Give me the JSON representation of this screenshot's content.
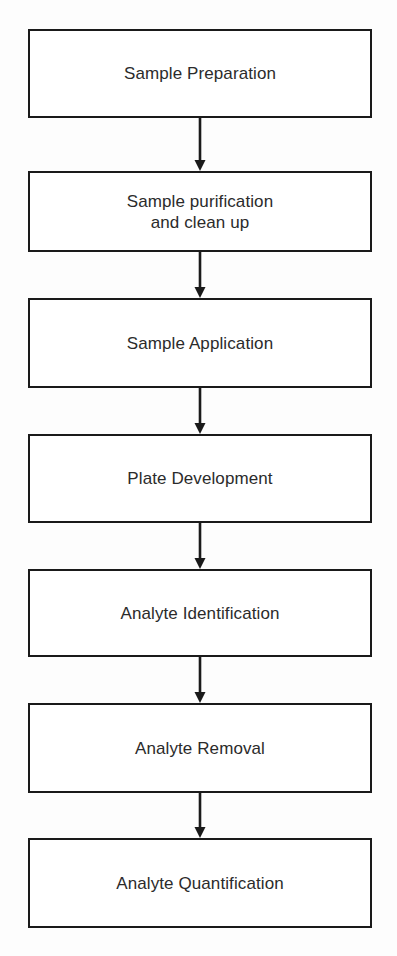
{
  "diagram": {
    "orientation": "vertical",
    "background_color": "#fdfdfd",
    "box_fill_color": "#ffffff",
    "line_color": "#1a1a1a",
    "text_color": "#2b2b2b",
    "nodes": [
      {
        "id": "sample-preparation",
        "label": "Sample Preparation",
        "top": 29,
        "height": 89
      },
      {
        "id": "sample-purification",
        "label": "Sample purification\nand clean up",
        "top": 171,
        "height": 81
      },
      {
        "id": "sample-application",
        "label": "Sample Application",
        "top": 298,
        "height": 90
      },
      {
        "id": "plate-development",
        "label": "Plate Development",
        "top": 434,
        "height": 89
      },
      {
        "id": "analyte-identification",
        "label": "Analyte Identification",
        "top": 569,
        "height": 88
      },
      {
        "id": "analyte-removal",
        "label": "Analyte Removal",
        "top": 703,
        "height": 90
      },
      {
        "id": "analyte-quantification",
        "label": "Analyte Quantification",
        "top": 838,
        "height": 90
      }
    ],
    "connectors": [
      {
        "id": "arrow-1",
        "from": "sample-preparation",
        "to": "sample-purification",
        "top": 118,
        "length": 53
      },
      {
        "id": "arrow-2",
        "from": "sample-purification",
        "to": "sample-application",
        "top": 252,
        "length": 46
      },
      {
        "id": "arrow-3",
        "from": "sample-application",
        "to": "plate-development",
        "top": 388,
        "length": 46
      },
      {
        "id": "arrow-4",
        "from": "plate-development",
        "to": "analyte-identification",
        "top": 523,
        "length": 46
      },
      {
        "id": "arrow-5",
        "from": "analyte-identification",
        "to": "analyte-removal",
        "top": 657,
        "length": 46
      },
      {
        "id": "arrow-6",
        "from": "analyte-removal",
        "to": "analyte-quantification",
        "top": 793,
        "length": 45
      }
    ]
  }
}
